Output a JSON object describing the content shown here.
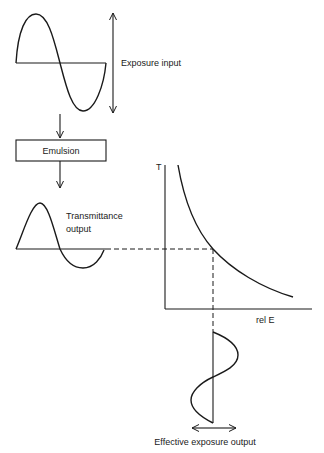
{
  "diagram": {
    "exposure_input": {
      "label": "Exposure input",
      "signal": "sine",
      "cycles": 1
    },
    "process_block": {
      "label": "Emulsion"
    },
    "transmittance_output": {
      "label_line1": "Transmittance",
      "label_line2": "output",
      "signal": "distorted-sine"
    },
    "characteristic_curve": {
      "y_axis_label": "T",
      "x_axis_label": "rel E",
      "shape": "decreasing-hyperbolic"
    },
    "effective_exposure_output": {
      "label": "Effective exposure output",
      "signal": "distorted-sine-vertical"
    },
    "colors": {
      "ink": "#1a1a1a",
      "background": "#ffffff"
    }
  }
}
